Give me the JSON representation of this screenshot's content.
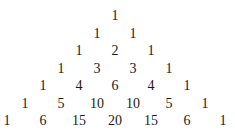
{
  "rows": [
    [
      1
    ],
    [
      1,
      1
    ],
    [
      1,
      2,
      1
    ],
    [
      1,
      3,
      3,
      1
    ],
    [
      1,
      4,
      6,
      4,
      1
    ],
    [
      1,
      5,
      10,
      10,
      5,
      1
    ],
    [
      1,
      6,
      15,
      20,
      15,
      6,
      1
    ]
  ]
}
